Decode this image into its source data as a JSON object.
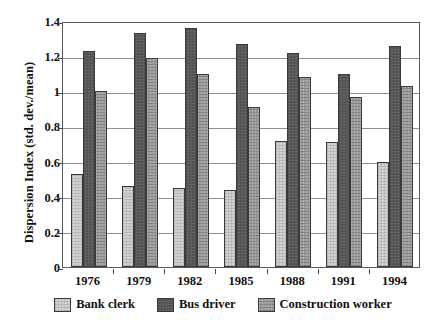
{
  "chart_data": {
    "type": "bar",
    "title": "",
    "subtitle": "",
    "xlabel": "",
    "ylabel": "Dispersion Index (std. dev./mean)",
    "categories": [
      "1976",
      "1979",
      "1982",
      "1985",
      "1988",
      "1991",
      "1994"
    ],
    "series": [
      {
        "name": "Bank clerk",
        "color": "#d2d2d2",
        "values": [
          0.53,
          0.46,
          0.45,
          0.44,
          0.72,
          0.71,
          0.6
        ]
      },
      {
        "name": "Bus driver",
        "color": "#585858",
        "values": [
          1.23,
          1.33,
          1.36,
          1.27,
          1.22,
          1.1,
          1.26
        ]
      },
      {
        "name": "Construction worker",
        "color": "#9b9b9b",
        "values": [
          1.0,
          1.19,
          1.1,
          0.91,
          1.08,
          0.97,
          1.03
        ]
      }
    ],
    "ylim": [
      0,
      1.4
    ],
    "ytick_labels": [
      "0",
      "0.2",
      "0.4",
      "0.6",
      "0.8",
      "1",
      "1.2",
      "1.4"
    ],
    "ytick_values": [
      0,
      0.2,
      0.4,
      0.6,
      0.8,
      1.0,
      1.2,
      1.4
    ],
    "grid": true,
    "grid_axis": "y",
    "legend_position": "bottom"
  }
}
